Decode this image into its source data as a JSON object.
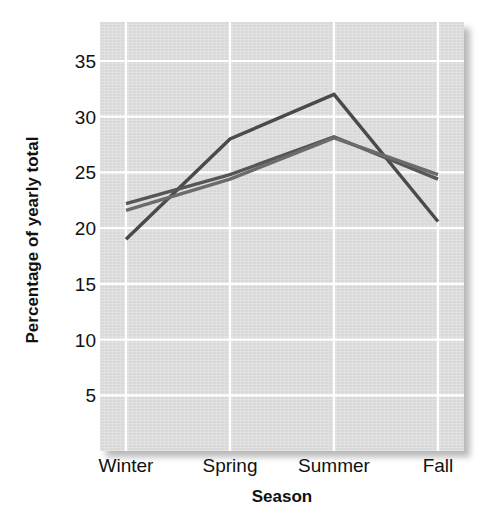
{
  "chart_data": {
    "type": "line",
    "title": "",
    "subtitle": "",
    "xlabel": "Season",
    "ylabel": "Percentage of yearly total",
    "categories": [
      "Winter",
      "Spring",
      "Summer",
      "Fall"
    ],
    "xtick_labels": [
      "Winter",
      "Spring",
      "Summer",
      "Fall"
    ],
    "ytick_labels": [
      "35",
      "30",
      "25",
      "20",
      "15",
      "10",
      "5"
    ],
    "ytick_values": [
      35,
      30,
      25,
      20,
      15,
      10,
      5
    ],
    "ylim": [
      0,
      38.5
    ],
    "xlim": [
      -0.25,
      3.25
    ],
    "grid": true,
    "grid_color": "#ffffff",
    "legend": "none",
    "panel_background": "#d9d9d9",
    "series": [
      {
        "name": "series-1",
        "color": "#4a4a4a",
        "values": [
          19.0,
          28.0,
          32.0,
          20.6
        ]
      },
      {
        "name": "series-2",
        "color": "#565656",
        "values": [
          22.2,
          24.8,
          28.2,
          24.4
        ]
      },
      {
        "name": "series-3",
        "color": "#6b6b6b",
        "values": [
          21.6,
          24.4,
          28.1,
          24.8
        ]
      }
    ],
    "annotations": []
  },
  "axis": {
    "y_title": "Percentage of yearly total",
    "x_title": "Season"
  }
}
